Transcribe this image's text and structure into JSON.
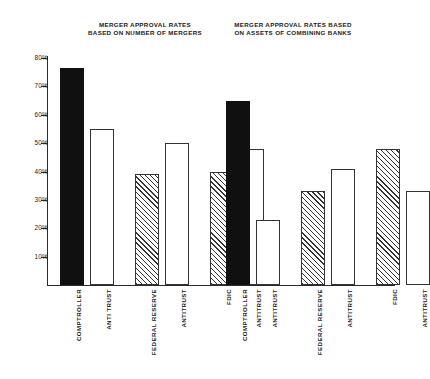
{
  "chart_data": {
    "type": "bar",
    "title": "MERGER APPROVAL RATES",
    "panels": [
      {
        "title_line1": "MERGER APPROVAL RATES",
        "title_line2": "BASED ON NUMBER OF MERGERS",
        "categories": [
          "COMPTROLLER",
          "ANTI TRUST",
          "FEDERAL RESERVE",
          "ANTITRUST",
          "FDIC",
          "ANTITRUST"
        ],
        "values": [
          76.5,
          55,
          39,
          50,
          40,
          48
        ],
        "fills": [
          "solid",
          "open",
          "hatch",
          "open",
          "hatch",
          "open"
        ]
      },
      {
        "title_line1": "MERGER APPROVAL RATES BASED",
        "title_line2": "ON ASSETS OF COMBINING BANKS",
        "categories": [
          "COMPTROLLER",
          "ANTITRUST",
          "FEDERAL RESERVE",
          "ANTITRUST",
          "FDIC",
          "ANTITRUST"
        ],
        "values": [
          65,
          23,
          33,
          41,
          48,
          33
        ],
        "fills": [
          "solid",
          "open",
          "hatch",
          "open",
          "hatch",
          "open"
        ]
      }
    ],
    "xlabel": "",
    "ylabel": "",
    "ylim": [
      0,
      80
    ],
    "yticks": [
      10,
      20,
      30,
      40,
      50,
      60,
      70,
      80
    ],
    "ytick_labels": [
      "10%",
      "20%",
      "30%",
      "40%",
      "50%",
      "60%",
      "70%",
      "80%"
    ],
    "grid": false,
    "legend": "none",
    "colors": {
      "solid": "#101010",
      "open": "#ffffff",
      "hatch_line": "#333333",
      "axis": "#2b2b2b",
      "text": "#1a1a1a",
      "background": "#ffffff"
    }
  }
}
